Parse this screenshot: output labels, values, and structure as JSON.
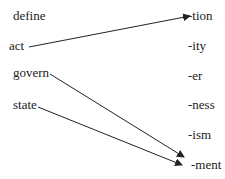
{
  "diagram": {
    "left_words": [
      {
        "label": "define",
        "x": 13,
        "y": 9
      },
      {
        "label": "act",
        "x": 9,
        "y": 39
      },
      {
        "label": "govern",
        "x": 13,
        "y": 66
      },
      {
        "label": "state",
        "x": 13,
        "y": 98
      }
    ],
    "suffixes": [
      {
        "label": "-tion",
        "x": 188,
        "y": 9
      },
      {
        "label": "-ity",
        "x": 188,
        "y": 39
      },
      {
        "label": "-er",
        "x": 188,
        "y": 69
      },
      {
        "label": "-ness",
        "x": 188,
        "y": 98
      },
      {
        "label": "-ism",
        "x": 188,
        "y": 128
      },
      {
        "label": "-ment",
        "x": 191,
        "y": 158
      }
    ],
    "arrows": [
      {
        "from": "act",
        "to": "-tion"
      },
      {
        "from": "govern",
        "to": "-ment"
      },
      {
        "from": "state",
        "to": "-ment"
      }
    ],
    "line_color": "#222222"
  }
}
